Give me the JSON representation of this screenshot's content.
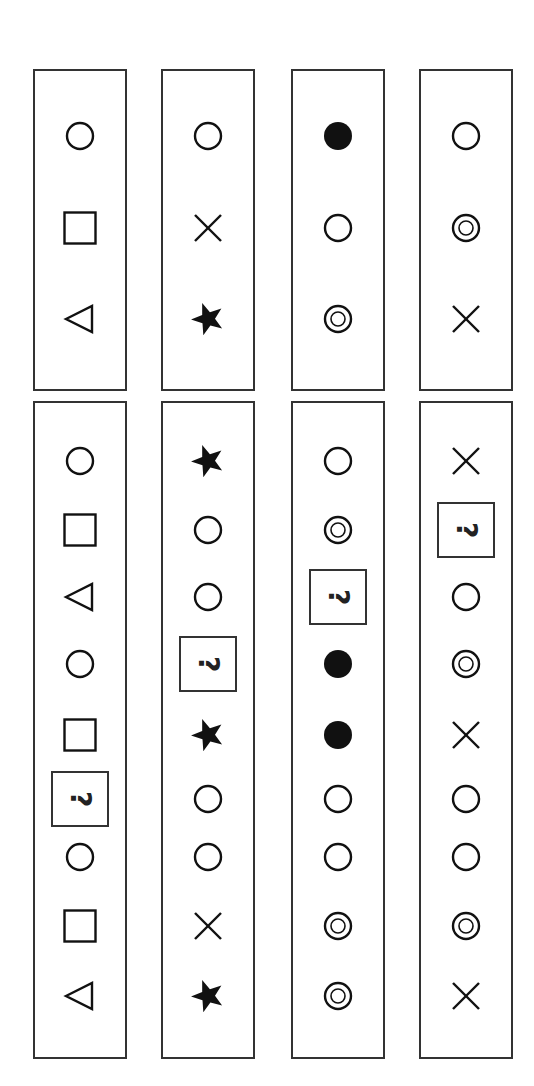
{
  "question_mark_text": "?",
  "colors": {
    "ink": "#111111",
    "border": "#333333",
    "background": "#ffffff"
  },
  "top_row": [
    [
      "circle",
      "square",
      "triangle-left"
    ],
    [
      "circle",
      "cross",
      "star"
    ],
    [
      "filled-circle",
      "circle",
      "double-circle"
    ],
    [
      "circle",
      "double-circle",
      "cross"
    ]
  ],
  "bottom_row": [
    [
      "circle",
      "square",
      "triangle-left",
      "circle",
      "square",
      "question",
      "circle",
      "square",
      "triangle-left"
    ],
    [
      "star",
      "circle",
      "circle",
      "question",
      "star",
      "circle",
      "circle",
      "cross",
      "star"
    ],
    [
      "circle",
      "double-circle",
      "question",
      "filled-circle",
      "filled-circle",
      "circle",
      "circle",
      "double-circle",
      "double-circle"
    ],
    [
      "cross",
      "question",
      "circle",
      "double-circle",
      "cross",
      "circle",
      "circle",
      "double-circle",
      "cross"
    ]
  ]
}
